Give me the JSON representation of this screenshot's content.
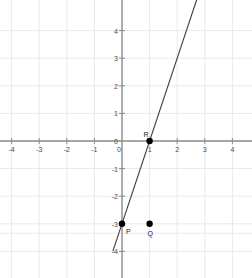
{
  "figure": {
    "kind": "coordinate-plane",
    "width": 252,
    "height": 278,
    "background_color": "#ffffff",
    "grid_color": "#e8e8ee",
    "axis_color": "#8a8a8a",
    "line_color": "#3a3a3a",
    "point_color": "#000000",
    "label_color": "#4a4a4a"
  },
  "axes": {
    "x_label_values": [
      "-4",
      "-3",
      "-2",
      "-1",
      "0",
      "1",
      "2",
      "3",
      "4"
    ],
    "y_label_values": [
      "4",
      "3",
      "2",
      "1",
      "0",
      "-1",
      "-2",
      "-3",
      "-4"
    ],
    "x_range": [
      -4.42,
      4.7
    ],
    "y_range": [
      -4.95,
      4.6
    ],
    "origin_px": {
      "x": 122,
      "y": 141
    },
    "unit_px": 27.6,
    "grid_on": true,
    "tick_length_px": 3
  },
  "chart_data": {
    "type": "scatter",
    "title": "",
    "xlabel": "",
    "ylabel": "",
    "xlim": [
      -4.42,
      4.7
    ],
    "ylim": [
      -4.95,
      4.6
    ],
    "grid": true,
    "legend": "none",
    "points": [
      {
        "label": "P",
        "x": 0,
        "y": -3,
        "label_dx_px": 4,
        "label_dy_px": 4
      },
      {
        "label": "Q",
        "x": 1,
        "y": -3,
        "label_dx_px": -2,
        "label_dy_px": 6
      },
      {
        "label": "R",
        "x": 1,
        "y": 0,
        "label_dx_px": -6,
        "label_dy_px": -10
      }
    ],
    "lines": [
      {
        "name": "line-through-P-and-R",
        "slope": 3,
        "intercept": -3,
        "through": [
          [
            0,
            -3
          ],
          [
            1,
            0
          ]
        ],
        "x_start": -0.33,
        "x_end": 2.79
      }
    ]
  }
}
